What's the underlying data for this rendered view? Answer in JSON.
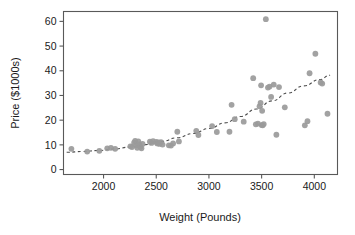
{
  "chart_data": {
    "type": "scatter",
    "title": "",
    "xlabel": "Weight (Pounds)",
    "ylabel": "Price ($1000s)",
    "xlim": [
      1620,
      4220
    ],
    "ylim": [
      -2,
      64
    ],
    "xticks": [
      2000,
      2500,
      3000,
      3500,
      4000
    ],
    "xtick_labels": [
      "2000",
      "2500",
      "3000",
      "3500",
      "4000"
    ],
    "yticks": [
      0,
      10,
      20,
      30,
      40,
      50,
      60
    ],
    "ytick_labels": [
      "0",
      "10",
      "20",
      "30",
      "40",
      "50",
      "60"
    ],
    "grid": false,
    "legend": null,
    "point_color": "#9a9a9a",
    "line_color": "#4d4d4d",
    "axis_color": "#595959",
    "series": [
      {
        "name": "Cars",
        "marker": "circle",
        "points": [
          [
            1695,
            8.4
          ],
          [
            1845,
            7.3
          ],
          [
            1960,
            7.6
          ],
          [
            2035,
            8.6
          ],
          [
            2070,
            8.8
          ],
          [
            2110,
            8.4
          ],
          [
            2255,
            9.4
          ],
          [
            2270,
            9.1
          ],
          [
            2290,
            10.9
          ],
          [
            2300,
            11.6
          ],
          [
            2310,
            9.8
          ],
          [
            2320,
            8.8
          ],
          [
            2330,
            11.4
          ],
          [
            2340,
            10.2
          ],
          [
            2350,
            9.2
          ],
          [
            2360,
            8.6
          ],
          [
            2370,
            10.4
          ],
          [
            2440,
            11.3
          ],
          [
            2455,
            10.8
          ],
          [
            2470,
            11.5
          ],
          [
            2500,
            11.2
          ],
          [
            2510,
            10.6
          ],
          [
            2520,
            11.0
          ],
          [
            2530,
            10.4
          ],
          [
            2545,
            11.1
          ],
          [
            2560,
            10.1
          ],
          [
            2620,
            9.8
          ],
          [
            2640,
            9.7
          ],
          [
            2660,
            10.6
          ],
          [
            2700,
            15.3
          ],
          [
            2715,
            11.4
          ],
          [
            2880,
            15.7
          ],
          [
            2900,
            14.0
          ],
          [
            3030,
            17.6
          ],
          [
            3075,
            15.2
          ],
          [
            3195,
            15.3
          ],
          [
            3215,
            26.2
          ],
          [
            3245,
            20.4
          ],
          [
            3330,
            19.4
          ],
          [
            3420,
            37.0
          ],
          [
            3445,
            18.3
          ],
          [
            3465,
            18.6
          ],
          [
            3480,
            25.6
          ],
          [
            3490,
            27.0
          ],
          [
            3495,
            34.1
          ],
          [
            3500,
            18.0
          ],
          [
            3505,
            23.8
          ],
          [
            3510,
            17.9
          ],
          [
            3520,
            18.4
          ],
          [
            3540,
            60.9
          ],
          [
            3560,
            33.2
          ],
          [
            3575,
            33.6
          ],
          [
            3590,
            29.4
          ],
          [
            3615,
            34.4
          ],
          [
            3640,
            14.1
          ],
          [
            3665,
            33.4
          ],
          [
            3720,
            25.2
          ],
          [
            3910,
            17.9
          ],
          [
            3935,
            19.6
          ],
          [
            3955,
            39.0
          ],
          [
            4010,
            46.9
          ],
          [
            4060,
            35.3
          ],
          [
            4075,
            34.8
          ],
          [
            4125,
            22.6
          ]
        ]
      }
    ],
    "trend": {
      "style": "dashed",
      "type": "exponential-fit",
      "points": [
        [
          1650,
          7.0
        ],
        [
          1800,
          7.3
        ],
        [
          1950,
          7.7
        ],
        [
          2100,
          8.3
        ],
        [
          2250,
          9.1
        ],
        [
          2400,
          10.1
        ],
        [
          2550,
          11.4
        ],
        [
          2700,
          12.9
        ],
        [
          2850,
          14.6
        ],
        [
          3000,
          16.6
        ],
        [
          3150,
          18.9
        ],
        [
          3300,
          21.5
        ],
        [
          3450,
          24.5
        ],
        [
          3600,
          27.8
        ],
        [
          3750,
          31.0
        ],
        [
          3900,
          33.9
        ],
        [
          4050,
          36.4
        ],
        [
          4150,
          38.2
        ]
      ]
    }
  }
}
